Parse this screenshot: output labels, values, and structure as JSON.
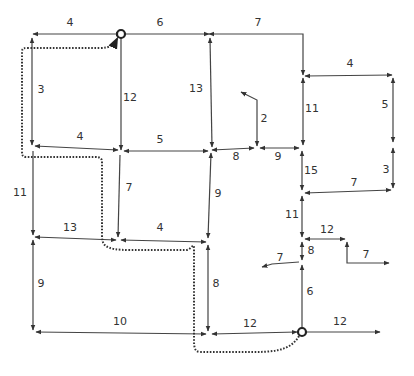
{
  "diagram": {
    "type": "directed weighted road network with highlighted route",
    "start_node": {
      "x": 121,
      "y": 34
    },
    "end_node": {
      "x": 302,
      "y": 332
    },
    "edges": [
      {
        "id": "e1",
        "label": "4",
        "points": [
          [
            121,
            34
          ],
          [
            33,
            34
          ]
        ],
        "arrow": "both",
        "lx": 70,
        "ly": 26
      },
      {
        "id": "e2",
        "label": "6",
        "points": [
          [
            121,
            34
          ],
          [
            209,
            34
          ]
        ],
        "arrow": "end",
        "lx": 160,
        "ly": 26
      },
      {
        "id": "e3",
        "label": "7",
        "points": [
          [
            209,
            34
          ],
          [
            303,
            34
          ],
          [
            303,
            75
          ]
        ],
        "arrow": "both",
        "lx": 258,
        "ly": 26
      },
      {
        "id": "e4",
        "label": "3",
        "points": [
          [
            32,
            38
          ],
          [
            32,
            145
          ]
        ],
        "arrow": "both",
        "lx": 41,
        "ly": 93
      },
      {
        "id": "e5",
        "label": "12",
        "points": [
          [
            121,
            38
          ],
          [
            121,
            150
          ]
        ],
        "arrow": "end",
        "lx": 130,
        "ly": 101
      },
      {
        "id": "e6",
        "label": "13",
        "points": [
          [
            210,
            38
          ],
          [
            212,
            147
          ]
        ],
        "arrow": "both",
        "lx": 196,
        "ly": 92
      },
      {
        "id": "e7",
        "label": "4",
        "points": [
          [
            118,
            150
          ],
          [
            35,
            146
          ]
        ],
        "arrow": "both",
        "lx": 80,
        "ly": 140
      },
      {
        "id": "e8",
        "label": "5",
        "points": [
          [
            124,
            151
          ],
          [
            208,
            151
          ]
        ],
        "arrow": "both",
        "lx": 160,
        "ly": 143
      },
      {
        "id": "e9",
        "label": "8",
        "points": [
          [
            212,
            150
          ],
          [
            254,
            148
          ]
        ],
        "arrow": "both",
        "lx": 236,
        "ly": 160
      },
      {
        "id": "e10",
        "label": "9",
        "points": [
          [
            260,
            148
          ],
          [
            299,
            148
          ]
        ],
        "arrow": "both",
        "lx": 278,
        "ly": 160
      },
      {
        "id": "e11",
        "label": "2",
        "points": [
          [
            257,
            146
          ],
          [
            257,
            100
          ],
          [
            241,
            92
          ]
        ],
        "arrow": "both",
        "lx": 264,
        "ly": 122
      },
      {
        "id": "e12",
        "label": "11",
        "points": [
          [
            303,
            78
          ],
          [
            303,
            145
          ]
        ],
        "arrow": "both",
        "lx": 312,
        "ly": 112
      },
      {
        "id": "e13",
        "label": "4",
        "points": [
          [
            305,
            76
          ],
          [
            392,
            75
          ]
        ],
        "arrow": "both",
        "lx": 350,
        "ly": 67
      },
      {
        "id": "e14",
        "label": "5",
        "points": [
          [
            393,
            78
          ],
          [
            393,
            142
          ]
        ],
        "arrow": "both",
        "lx": 385,
        "ly": 108
      },
      {
        "id": "e15",
        "label": "3",
        "points": [
          [
            393,
            148
          ],
          [
            393,
            188
          ]
        ],
        "arrow": "both",
        "lx": 386,
        "ly": 173
      },
      {
        "id": "e16",
        "label": "15",
        "points": [
          [
            302,
            151
          ],
          [
            302,
            190
          ]
        ],
        "arrow": "both",
        "lx": 311,
        "ly": 174
      },
      {
        "id": "e17",
        "label": "7",
        "points": [
          [
            305,
            193
          ],
          [
            391,
            190
          ]
        ],
        "arrow": "both",
        "lx": 354,
        "ly": 186
      },
      {
        "id": "e18",
        "label": "11",
        "points": [
          [
            33,
            151
          ],
          [
            33,
            235
          ]
        ],
        "arrow": "end",
        "lx": 20,
        "ly": 196
      },
      {
        "id": "e19",
        "label": "7",
        "points": [
          [
            120,
            155
          ],
          [
            118,
            237
          ]
        ],
        "arrow": "end",
        "lx": 129,
        "ly": 191
      },
      {
        "id": "e20",
        "label": "9",
        "points": [
          [
            211,
            153
          ],
          [
            208,
            238
          ]
        ],
        "arrow": "both",
        "lx": 218,
        "ly": 197
      },
      {
        "id": "e21",
        "label": "11",
        "points": [
          [
            302,
            196
          ],
          [
            302,
            237
          ]
        ],
        "arrow": "both",
        "lx": 292,
        "ly": 218
      },
      {
        "id": "e22",
        "label": "13",
        "points": [
          [
            35,
            237
          ],
          [
            116,
            240
          ]
        ],
        "arrow": "both",
        "lx": 70,
        "ly": 231
      },
      {
        "id": "e23",
        "label": "4",
        "points": [
          [
            121,
            240
          ],
          [
            206,
            242
          ]
        ],
        "arrow": "both",
        "lx": 160,
        "ly": 231
      },
      {
        "id": "e24",
        "label": "12",
        "points": [
          [
            305,
            239
          ],
          [
            345,
            239
          ]
        ],
        "arrow": "both",
        "lx": 327,
        "ly": 233
      },
      {
        "id": "e25",
        "label": "7",
        "points": [
          [
            347,
            242
          ],
          [
            347,
            263
          ],
          [
            389,
            263
          ]
        ],
        "arrow": "both",
        "lx": 366,
        "ly": 258
      },
      {
        "id": "e26",
        "label": "8",
        "points": [
          [
            302,
            242
          ],
          [
            302,
            260
          ]
        ],
        "arrow": "both",
        "lx": 311,
        "ly": 254
      },
      {
        "id": "e27",
        "label": "7",
        "points": [
          [
            299,
            262
          ],
          [
            272,
            264
          ],
          [
            262,
            267
          ]
        ],
        "arrow": "end",
        "lx": 280,
        "ly": 261
      },
      {
        "id": "e28",
        "label": "6",
        "points": [
          [
            302,
            265
          ],
          [
            302,
            328
          ]
        ],
        "arrow": "start",
        "lx": 310,
        "ly": 295
      },
      {
        "id": "e29",
        "label": "9",
        "points": [
          [
            33,
            240
          ],
          [
            33,
            330
          ]
        ],
        "arrow": "both",
        "lx": 41,
        "ly": 287
      },
      {
        "id": "e30",
        "label": "8",
        "points": [
          [
            208,
            245
          ],
          [
            208,
            331
          ]
        ],
        "arrow": "both",
        "lx": 216,
        "ly": 287
      },
      {
        "id": "e31",
        "label": "10",
        "points": [
          [
            36,
            332
          ],
          [
            206,
            334
          ]
        ],
        "arrow": "both",
        "lx": 120,
        "ly": 325
      },
      {
        "id": "e32",
        "label": "12",
        "points": [
          [
            212,
            334
          ],
          [
            297,
            332
          ]
        ],
        "arrow": "both",
        "lx": 250,
        "ly": 327
      },
      {
        "id": "e33",
        "label": "12",
        "points": [
          [
            307,
            332
          ],
          [
            380,
            332
          ]
        ],
        "arrow": "end",
        "lx": 340,
        "ly": 325
      }
    ],
    "route": {
      "style": "dotted",
      "path": "M299,336 C290,352 270,352 250,352 L200,352 C194,352 194,345 194,340 L194,250 C194,240 192,250 186,250 L130,250 C104,250 102,245 102,235 L102,162 C102,158 100,157 95,157 L26,157 C22,157 22,154 22,150 L22,52 C22,48 24,48 28,48 L100,48 C110,48 114,45 117,39"
    }
  }
}
